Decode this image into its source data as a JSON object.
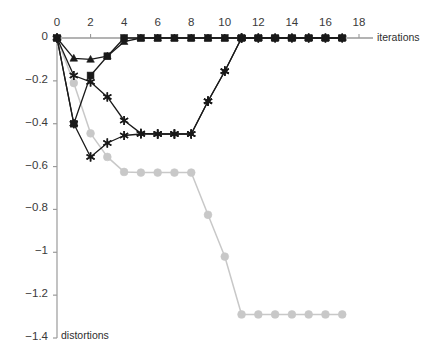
{
  "chart_data": {
    "type": "line",
    "title": "",
    "subtitle": "",
    "xlabel": "iterations",
    "ylabel": "distortions",
    "xlim": [
      0,
      18.8
    ],
    "ylim": [
      -1.4,
      0.04
    ],
    "xticks": [
      0,
      2,
      4,
      6,
      8,
      10,
      12,
      14,
      16,
      18
    ],
    "xticklabels": [
      "0",
      "2",
      "4",
      "6",
      "8",
      "10",
      "12",
      "14",
      "16",
      "18"
    ],
    "yticks": [
      0,
      -0.2,
      -0.4,
      -0.6,
      -0.8,
      -1,
      -1.2,
      -1.4
    ],
    "yticklabels": [
      "0",
      "−0.2",
      "−0.4",
      "−0.6",
      "−0.8",
      "−1",
      "−1.2",
      "−1.4"
    ],
    "grid": false,
    "legend": null,
    "legend_position": "none",
    "axis_top_line": true,
    "colors": {
      "black": "#1a1a1a",
      "gray": "#c8c8c8",
      "axis": "#9a9a9a",
      "tick_text": "#3a3a3a"
    },
    "series": [
      {
        "name": "series-black-square",
        "color": "#1a1a1a",
        "marker": "square",
        "x": [
          0,
          1,
          2,
          3,
          4,
          5,
          6,
          7,
          8,
          9,
          10,
          11,
          12,
          13,
          14,
          15,
          16,
          17
        ],
        "values": [
          0,
          -0.4,
          -0.175,
          -0.085,
          0,
          0,
          0,
          0,
          0,
          0,
          0,
          0,
          0,
          0,
          0,
          0,
          0,
          0
        ]
      },
      {
        "name": "series-black-triangle",
        "color": "#1a1a1a",
        "marker": "triangle",
        "x": [
          0,
          1,
          2,
          3,
          4,
          5,
          6,
          7,
          8,
          9,
          10,
          11,
          12,
          13,
          14,
          15,
          16,
          17
        ],
        "values": [
          0,
          -0.095,
          -0.1,
          -0.085,
          -0.017,
          0,
          0,
          0,
          0,
          0,
          0,
          0,
          0,
          0,
          0,
          0,
          0,
          0
        ]
      },
      {
        "name": "series-black-star-deep",
        "color": "#1a1a1a",
        "marker": "star",
        "x": [
          0,
          1,
          2,
          3,
          4,
          5,
          6,
          7,
          8,
          9,
          10,
          11,
          12,
          13,
          14,
          15,
          16,
          17
        ],
        "values": [
          0,
          -0.175,
          -0.205,
          -0.275,
          -0.385,
          -0.445,
          -0.448,
          -0.448,
          -0.448,
          -0.295,
          -0.155,
          0,
          0,
          0,
          0,
          0,
          0,
          0
        ]
      },
      {
        "name": "series-black-star-shallow",
        "color": "#1a1a1a",
        "marker": "star",
        "x": [
          0,
          1,
          2,
          3,
          4,
          5,
          6,
          7,
          8,
          9,
          10,
          11
        ],
        "values": [
          0,
          -0.4,
          -0.555,
          -0.49,
          -0.455,
          -0.448,
          -0.448,
          -0.448,
          -0.448,
          -0.295,
          -0.155,
          0
        ]
      },
      {
        "name": "series-gray-circle",
        "color": "#c8c8c8",
        "marker": "circle",
        "x": [
          0,
          1,
          2,
          3,
          4,
          5,
          6,
          7,
          8,
          9,
          10,
          11,
          12,
          13,
          14,
          15,
          16,
          17
        ],
        "values": [
          0,
          -0.21,
          -0.445,
          -0.555,
          -0.625,
          -0.628,
          -0.628,
          -0.628,
          -0.628,
          -0.825,
          -1.02,
          -1.29,
          -1.29,
          -1.29,
          -1.29,
          -1.29,
          -1.29,
          -1.29
        ]
      }
    ]
  }
}
